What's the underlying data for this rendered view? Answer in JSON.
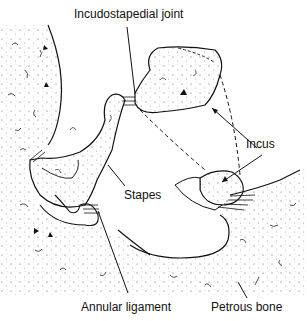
{
  "figure": {
    "type": "anatomical-diagram",
    "colors": {
      "ink": "#111111",
      "background": "#ffffff",
      "stipple": "#555555"
    }
  },
  "labels": {
    "incudostapedial_joint": "Incudostapedial joint",
    "incus": "Incus",
    "stapes": "Stapes",
    "annular_ligament": "Annular ligament",
    "petrous_bone": "Petrous bone"
  }
}
